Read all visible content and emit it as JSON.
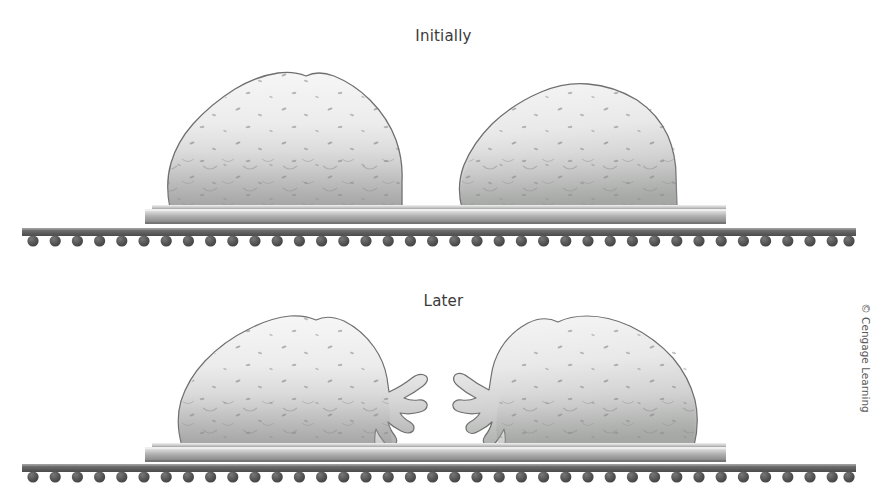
{
  "figure": {
    "name": "particle-coalescence-diagram",
    "background_color": "#ffffff",
    "width": 887,
    "height": 488
  },
  "panels": [
    {
      "key": "initially",
      "label": "Initially",
      "label_top": 27,
      "state": "two separate rounded particles sitting apart on the plate"
    },
    {
      "key": "later",
      "label": "Later",
      "label_top": 292,
      "state": "two particles with finger-like tendrils stretching toward each other across the gap"
    }
  ],
  "credit": {
    "text": "© Cengage Learning",
    "orientation": "vertical"
  },
  "colors": {
    "label_text": "#3a3a3a",
    "credit_text": "#5a5a5a",
    "particle_outline": "#6f6f6f",
    "particle_fill_top": "#f4f4f4",
    "particle_fill_bottom": "#b4b4b4",
    "particle_speckle": "#6b6b6b",
    "plate_top": "#e8e8e8",
    "plate_bottom": "#8e8e8e",
    "rail_dark": "#5a5a5a",
    "rail_light": "#9a9a9a",
    "atom_dot": "#4f4f4f"
  },
  "geometry": {
    "plate": {
      "left": 145,
      "right": 726,
      "top_initially": 205,
      "top_later": 443,
      "thickness": 16
    },
    "rail": {
      "left": 22,
      "right": 856,
      "top_initially": 228,
      "top_later": 464,
      "thickness": 8
    },
    "atoms": {
      "count": 38,
      "spacing": 22.2,
      "radius": 5.6,
      "first_center_x": 33
    },
    "particles_initially": [
      {
        "center_x": 285,
        "base_y": 208,
        "width": 230,
        "height": 142
      },
      {
        "center_x": 580,
        "base_y": 208,
        "width": 225,
        "height": 135
      }
    ],
    "particles_later": [
      {
        "center_x": 295,
        "base_y": 446,
        "width": 225,
        "height": 132,
        "tendril_side": "right"
      },
      {
        "center_x": 590,
        "base_y": 446,
        "width": 225,
        "height": 132,
        "tendril_side": "left"
      }
    ]
  }
}
